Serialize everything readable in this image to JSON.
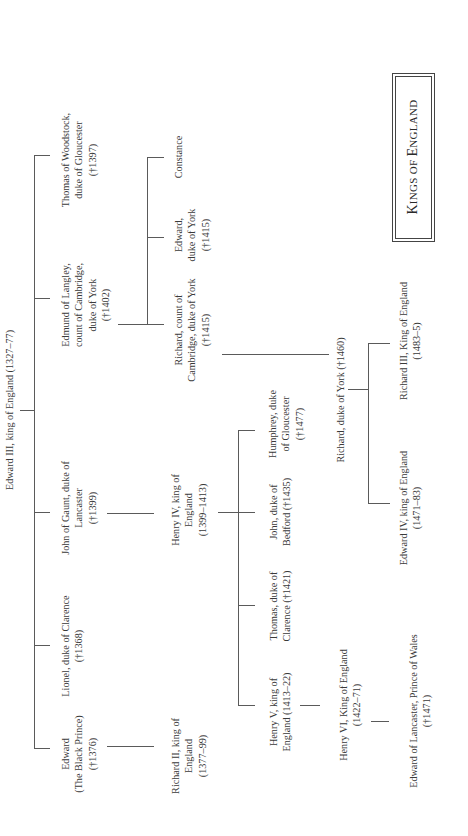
{
  "title": {
    "first": "K",
    "rest1": "INGS OF ",
    "second": "E",
    "rest2": "NGLAND",
    "full": "Kings of England"
  },
  "root": {
    "name": "Edward III, king of England (1327–77)"
  },
  "generation1": [
    {
      "lines": [
        "Thomas of Woodstock,",
        "duke of Gloucester",
        "(†1397)"
      ]
    },
    {
      "lines": [
        "Edmund of Langley,",
        "count of Cambridge,",
        "duke of York",
        "(†1402)"
      ]
    },
    {
      "lines": [
        "John of Gaunt, duke of",
        "Lancaster",
        "(†1399)"
      ]
    },
    {
      "lines": [
        "Lionel, duke of Clarence",
        "(†1368)"
      ]
    },
    {
      "lines": [
        "Edward",
        "(The Black Prince)",
        "(†1376)"
      ]
    }
  ],
  "york_children": [
    {
      "lines": [
        "Constance"
      ]
    },
    {
      "lines": [
        "Edward,",
        "duke of York",
        "(†1415)"
      ]
    },
    {
      "lines": [
        "Richard, count of",
        "Cambridge, duke of York",
        "(†1415)"
      ]
    }
  ],
  "henry_iv": {
    "lines": [
      "Henry IV, king of",
      "England",
      "(1399–1413)"
    ]
  },
  "richard_ii": {
    "lines": [
      "Richard II, king of",
      "England",
      "(1377–99)"
    ]
  },
  "henry_iv_children": [
    {
      "lines": [
        "Humphrey, duke",
        "of Gloucester",
        "(†1477)"
      ]
    },
    {
      "lines": [
        "John, duke of",
        "Bedford (†1435)"
      ]
    },
    {
      "lines": [
        "Thomas, duke of",
        "Clarence (†1421)"
      ]
    },
    {
      "lines": [
        "Henry V, king of",
        "England (1413–22)"
      ]
    }
  ],
  "richard_duke_of_york": {
    "name": "Richard, duke of York (†1460)"
  },
  "york_kings": [
    {
      "lines": [
        "Richard III, King of England",
        "(1483–5)"
      ]
    },
    {
      "lines": [
        "Edward IV, king of England",
        "(1471–83)"
      ]
    }
  ],
  "henry_vi": {
    "lines": [
      "Henry VI, King of England",
      "(1422–71)"
    ]
  },
  "edward_of_lancaster": {
    "lines": [
      "Edward of Lancaster, Prince of Wales",
      "(†1471)"
    ]
  }
}
